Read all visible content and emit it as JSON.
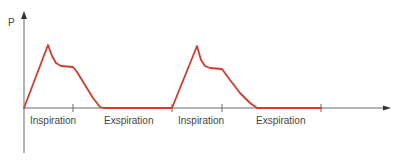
{
  "chart_data": {
    "type": "line",
    "title": "",
    "xlabel": "",
    "ylabel": "P",
    "grid": false,
    "legend": null,
    "colors": {
      "curve": "#d8392a",
      "axis": "#6b6b6b",
      "text": "#444444"
    },
    "phase_labels": [
      "Inspiration",
      "Exspiration",
      "Inspiration",
      "Exspiration"
    ],
    "tick_positions_px": [
      73,
      172,
      222,
      321
    ],
    "series": [
      {
        "name": "Pressure",
        "points_px": [
          [
            24,
            108
          ],
          [
            48,
            45
          ],
          [
            52,
            56
          ],
          [
            56,
            63
          ],
          [
            61,
            66
          ],
          [
            73,
            67
          ],
          [
            77,
            72
          ],
          [
            85,
            85
          ],
          [
            93,
            98
          ],
          [
            100,
            107
          ],
          [
            104,
            108
          ],
          [
            172,
            108
          ],
          [
            197,
            46
          ],
          [
            201,
            60
          ],
          [
            205,
            66
          ],
          [
            210,
            68
          ],
          [
            222,
            69
          ],
          [
            230,
            80
          ],
          [
            240,
            93
          ],
          [
            250,
            103
          ],
          [
            257,
            108
          ],
          [
            321,
            108
          ]
        ]
      }
    ]
  },
  "labels": {
    "y_axis": "P",
    "phase_1": "Inspiration",
    "phase_2": "Exspiration",
    "phase_3": "Inspiration",
    "phase_4": "Exspiration"
  }
}
